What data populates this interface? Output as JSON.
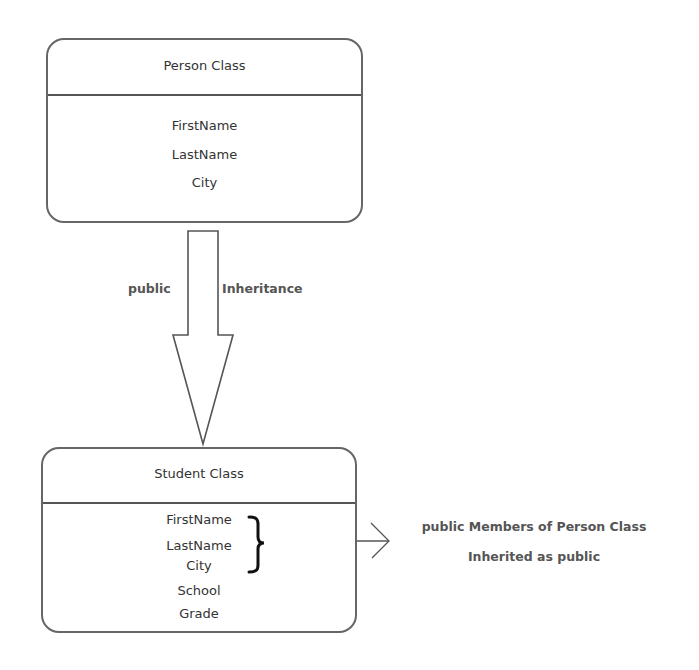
{
  "diagram": {
    "parent_class": {
      "name": "Person Class",
      "members": [
        "FirstName",
        "LastName",
        "City"
      ]
    },
    "child_class": {
      "name": "Student Class",
      "members": [
        "FirstName",
        "LastName",
        "City",
        "School",
        "Grade"
      ],
      "inherited_members": [
        "FirstName",
        "LastName",
        "City"
      ],
      "own_members": [
        "School",
        "Grade"
      ]
    },
    "inheritance_arrow": {
      "left_label": "public",
      "right_label": "Inheritance",
      "direction": "down"
    },
    "annotation": {
      "line1": "public Members of Person Class",
      "line2": "Inherited as public"
    },
    "colors": {
      "box_border": "#666666",
      "text": "#333333",
      "label_text": "#555555",
      "arrow_stroke": "#555555",
      "background": "#ffffff"
    }
  }
}
